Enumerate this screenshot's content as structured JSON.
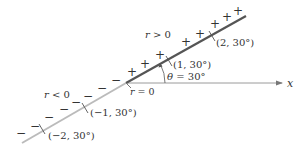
{
  "diagram": {
    "colors": {
      "positive_ray": "#555555",
      "negative_ray": "#b8b8b8",
      "axis": "#999999",
      "text": "#333333"
    },
    "labels": {
      "r_positive": "r > 0",
      "r_negative": "r < 0",
      "origin": "r = 0",
      "angle": "θ = 30°",
      "x_axis": "x",
      "p1": "(1, 30°)",
      "p2": "(2, 30°)",
      "pn1": "(−1, 30°)",
      "pn2": "(−2, 30°)"
    },
    "signs": {
      "plus": "+",
      "minus": "−"
    },
    "points": [
      {
        "r": 1,
        "theta_deg": 30,
        "label": "(1, 30°)"
      },
      {
        "r": 2,
        "theta_deg": 30,
        "label": "(2, 30°)"
      },
      {
        "r": -1,
        "theta_deg": 30,
        "label": "(−1, 30°)"
      },
      {
        "r": -2,
        "theta_deg": 30,
        "label": "(−2, 30°)"
      }
    ]
  }
}
